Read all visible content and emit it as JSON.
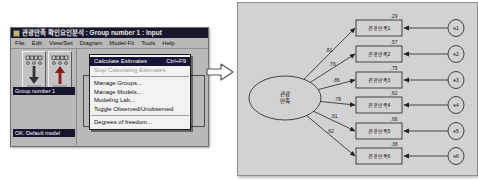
{
  "window": {
    "title": "관광만족 확인요인분석 : Group number 1 : Input",
    "menu_bar": [
      "File",
      "Edit",
      "View/Set",
      "Diagram",
      "Model-Fit",
      "Tools",
      "Help"
    ],
    "sidebar": {
      "group_label": "Group number 1",
      "model_label": "OK: Default model",
      "toolbar_icons": [
        "input-path-diagram",
        "output-path-diagram"
      ]
    },
    "dropdown": {
      "items": [
        {
          "label": "Calculate Estimates",
          "shortcut": "Ctrl+F9",
          "state": "selected"
        },
        {
          "label": "Stop Calculating Estimates",
          "state": "disabled"
        },
        {
          "separator": true
        },
        {
          "label": "Manage Groups...",
          "state": "normal"
        },
        {
          "label": "Manage Models...",
          "state": "normal"
        },
        {
          "label": "Modeling Lab...",
          "state": "normal"
        },
        {
          "label": "Toggle Observed/Unobserved",
          "state": "normal"
        },
        {
          "separator": true
        },
        {
          "label": "Degrees of freedom...",
          "state": "normal"
        }
      ]
    }
  },
  "diagram": {
    "latent": {
      "label_lines": [
        "관광",
        "만족"
      ]
    },
    "indicators": [
      {
        "label": "관광만족1",
        "loading": ".81",
        "smc": ".29",
        "error": "e1"
      },
      {
        "label": "관광만족2",
        "loading": ".76",
        "smc": ".57",
        "error": "e2"
      },
      {
        "label": "관광만족3",
        "loading": ".86",
        "smc": ".75",
        "error": "e3"
      },
      {
        "label": "관광만족4",
        "loading": ".78",
        "smc": ".62",
        "error": "e4"
      },
      {
        "label": "관광만족5",
        "loading": ".81",
        "smc": ".66",
        "error": "e5"
      },
      {
        "label": "관광만족6",
        "loading": ".62",
        "smc": ".38",
        "error": "e6"
      }
    ]
  },
  "colors": {
    "title_bar": "#17172e",
    "menu_highlight": "#15153a",
    "window_gray": "#b9b9b9",
    "panel_gray": "#d2d2d2",
    "shape_stroke": "#333333",
    "arrow_red": "#8b1a1a"
  }
}
